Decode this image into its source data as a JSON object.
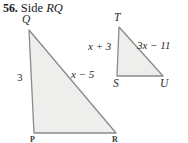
{
  "problem": {
    "number": "56.",
    "instruction_word": "Side",
    "target_segment": "RQ"
  },
  "figures": {
    "large_triangle": {
      "name": "triangle-PQR",
      "vertices": [
        {
          "label": "Q",
          "x": 29,
          "y": 30
        },
        {
          "label": "P",
          "x": 34,
          "y": 133
        },
        {
          "label": "R",
          "x": 116,
          "y": 133
        }
      ],
      "side_labels": [
        {
          "text": "3",
          "side": "QP"
        },
        {
          "text": "x − 5",
          "side": "QR"
        }
      ],
      "fill": "#eeeeec",
      "stroke": "#8a8a8a"
    },
    "small_triangle": {
      "name": "triangle-STU",
      "vertices": [
        {
          "label": "T",
          "x": 119,
          "y": 27
        },
        {
          "label": "S",
          "x": 117,
          "y": 76
        },
        {
          "label": "U",
          "x": 163,
          "y": 76
        }
      ],
      "side_labels": [
        {
          "text": "x + 3",
          "side": "TS"
        },
        {
          "text": "3x − 11",
          "side": "TU"
        }
      ],
      "fill": "#eeeeec",
      "stroke": "#8a8a8a"
    }
  }
}
